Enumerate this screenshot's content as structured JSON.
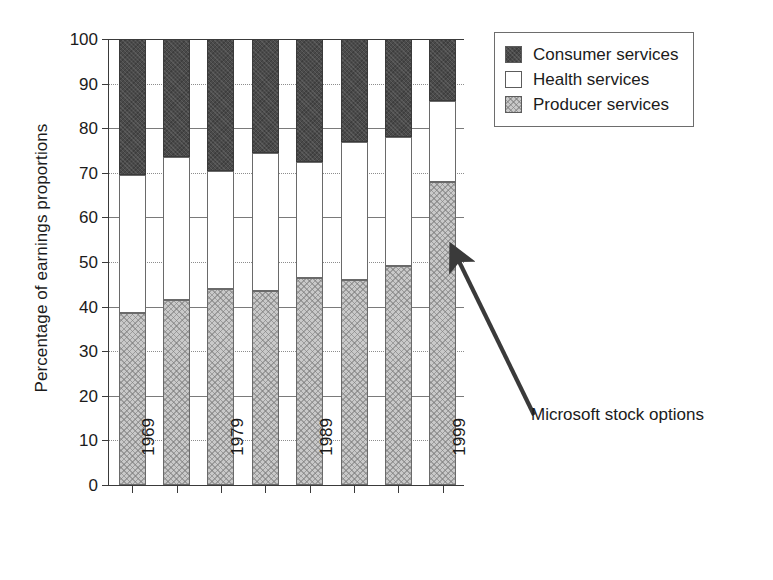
{
  "chart_data": {
    "type": "bar",
    "subtype": "stacked-percentage",
    "title": "",
    "xlabel": "",
    "ylabel": "Percentage of earnings proportions",
    "ylim": [
      0,
      100
    ],
    "ytick_step": 10,
    "yticks": [
      100,
      90,
      80,
      70,
      60,
      50,
      40,
      30,
      20,
      10,
      0
    ],
    "ytick_labels": [
      "100",
      "90",
      "80",
      "70",
      "60",
      "50",
      "40",
      "30",
      "20",
      "10",
      "0"
    ],
    "grid": true,
    "grid_axis": "y",
    "legend_position": "top-right",
    "bar_count": 8,
    "categories": [
      "1969",
      "",
      "1979",
      "",
      "1989",
      "",
      "",
      "1999"
    ],
    "tick_labels_visible": [
      "1969",
      "1979",
      "1989",
      "1999"
    ],
    "series": [
      {
        "name": "Producer services",
        "color": "#c9c9c9",
        "pattern": "cross-hatch-light",
        "values": [
          38.5,
          41.5,
          44.0,
          43.5,
          46.5,
          46.0,
          49.0,
          68.0
        ]
      },
      {
        "name": "Health services",
        "color": "#ffffff",
        "pattern": "none",
        "values": [
          31.0,
          32.0,
          26.5,
          31.0,
          26.0,
          31.0,
          29.0,
          18.0
        ]
      },
      {
        "name": "Consumer services",
        "color": "#4a4a4a",
        "pattern": "solid-dark",
        "values": [
          30.5,
          26.5,
          29.5,
          25.5,
          27.5,
          23.0,
          22.0,
          14.0
        ]
      }
    ],
    "cumulative_tops": {
      "producer": [
        38.5,
        41.5,
        44.0,
        43.5,
        46.5,
        46.0,
        49.0,
        68.0
      ],
      "health": [
        69.5,
        73.5,
        70.5,
        74.5,
        72.5,
        77.0,
        78.0,
        86.0
      ],
      "consumer": [
        100,
        100,
        100,
        100,
        100,
        100,
        100,
        100
      ]
    },
    "annotations": [
      {
        "text": "Microsoft stock options",
        "points_to_bar_index": 7,
        "points_to_value": 57,
        "arrow": true
      }
    ]
  },
  "legend": {
    "items": [
      {
        "label": "Consumer services",
        "key": "consumer"
      },
      {
        "label": "Health services",
        "key": "health"
      },
      {
        "label": "Producer services",
        "key": "producer"
      }
    ]
  },
  "axes": {
    "y_title": "Percentage of earnings proportions",
    "y_labels": [
      "100",
      "90",
      "80",
      "70",
      "60",
      "50",
      "40",
      "30",
      "20",
      "10",
      "0"
    ],
    "x_labels": [
      "1969",
      "1979",
      "1989",
      "1999"
    ]
  },
  "annotation": {
    "label": "Microsoft stock options"
  }
}
